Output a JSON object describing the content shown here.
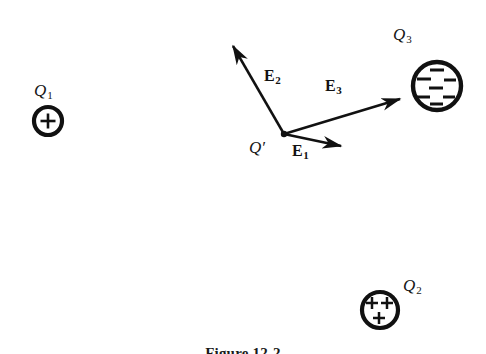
{
  "figure": {
    "caption": "Figure 12-2",
    "background_color": "#ffffff",
    "ink_color": "#111111"
  },
  "charges": [
    {
      "id": "q1",
      "label": "Q",
      "subscript": "1",
      "sign": "positive",
      "sign_glyph": "+",
      "sign_count": 1,
      "center": [
        48,
        121
      ],
      "radius": 14,
      "label_position": [
        34,
        82
      ]
    },
    {
      "id": "q3",
      "label": "Q",
      "subscript": "3",
      "sign": "negative",
      "sign_glyph": "−",
      "sign_count": 7,
      "center": [
        437,
        86
      ],
      "radius": 24,
      "label_position": [
        393,
        26
      ]
    },
    {
      "id": "q2",
      "label": "Q",
      "subscript": "2",
      "sign": "positive",
      "sign_glyph": "+",
      "sign_count": 3,
      "center": [
        380,
        310
      ],
      "radius": 18,
      "label_position": [
        403,
        277
      ]
    }
  ],
  "test_charge": {
    "id": "q-prime",
    "label": "Q′",
    "point": [
      284,
      134
    ],
    "dot_radius": 3.2,
    "label_position": [
      249,
      139
    ]
  },
  "vectors": [
    {
      "id": "e1",
      "label": "E",
      "subscript": "1",
      "from": [
        284,
        134
      ],
      "to": [
        345,
        147
      ],
      "label_position": [
        292,
        143
      ],
      "describes": "field at Q′ due to Q1"
    },
    {
      "id": "e2",
      "label": "E",
      "subscript": "2",
      "from": [
        284,
        134
      ],
      "to": [
        229,
        39
      ],
      "label_position": [
        264,
        68
      ],
      "describes": "field at Q′ due to Q2"
    },
    {
      "id": "e3",
      "label": "E",
      "subscript": "3",
      "from": [
        284,
        134
      ],
      "to": [
        406,
        97
      ],
      "label_position": [
        325,
        78
      ],
      "describes": "field at Q′ due to Q3"
    }
  ]
}
